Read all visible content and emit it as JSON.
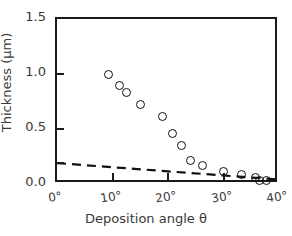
{
  "chart_data": {
    "type": "scatter",
    "title": "",
    "xlabel": "Deposition angle  θ",
    "ylabel": "Thickness (μm)",
    "xlim": [
      0,
      40
    ],
    "ylim": [
      0.0,
      1.5
    ],
    "grid": false,
    "legend": "none",
    "x_tick_values": [
      0,
      10,
      20,
      30,
      40
    ],
    "x_tick_labels": [
      "0°",
      "10°",
      "20°",
      "30°",
      "40°"
    ],
    "y_tick_values": [
      0.0,
      0.5,
      1.0,
      1.5
    ],
    "y_tick_labels": [
      "0.0",
      "0.5",
      "1.0",
      "1.5"
    ],
    "series": [
      {
        "name": "Measured thickness",
        "marker": "open-circle",
        "color": "#111111",
        "points": [
          {
            "x": 9.3,
            "y": 1.0
          },
          {
            "x": 11.2,
            "y": 0.9
          },
          {
            "x": 12.6,
            "y": 0.83
          },
          {
            "x": 15.0,
            "y": 0.72
          },
          {
            "x": 19.0,
            "y": 0.61
          },
          {
            "x": 20.9,
            "y": 0.46
          },
          {
            "x": 22.5,
            "y": 0.35
          },
          {
            "x": 24.0,
            "y": 0.21
          },
          {
            "x": 26.2,
            "y": 0.17
          },
          {
            "x": 30.0,
            "y": 0.11
          },
          {
            "x": 33.3,
            "y": 0.09
          },
          {
            "x": 35.7,
            "y": 0.055
          },
          {
            "x": 36.5,
            "y": 0.035
          },
          {
            "x": 37.7,
            "y": 0.03
          }
        ]
      },
      {
        "name": "Dashed reference line",
        "marker": "none",
        "style": "dashed",
        "color": "#111111",
        "points": [
          {
            "x": 0.0,
            "y": 0.19
          },
          {
            "x": 40.0,
            "y": 0.04
          }
        ]
      }
    ]
  },
  "axes": {
    "frame_color": "#1a1a1a",
    "tick_label_color": "#3a3a3a"
  }
}
